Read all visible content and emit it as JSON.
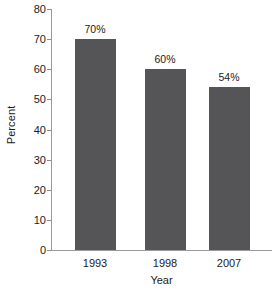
{
  "chart_data": {
    "type": "bar",
    "title": "",
    "xlabel": "Year",
    "ylabel": "Percent",
    "categories": [
      "1993",
      "1998",
      "2007"
    ],
    "values": [
      70,
      60,
      54
    ],
    "value_labels": [
      "70%",
      "60%",
      "54%"
    ],
    "ylim": [
      0,
      80
    ],
    "yticks": [
      0,
      10,
      20,
      30,
      40,
      50,
      60,
      70,
      80
    ],
    "ytick_labels": [
      "0",
      "10",
      "20",
      "30",
      "40",
      "50",
      "60",
      "70",
      "80"
    ],
    "grid": false,
    "legend": false,
    "legend_position": "none",
    "bar_color": "#555558",
    "axis_color": "#9a9a9a",
    "background_color": "#ffffff",
    "text_color": "#1a1a1a"
  }
}
